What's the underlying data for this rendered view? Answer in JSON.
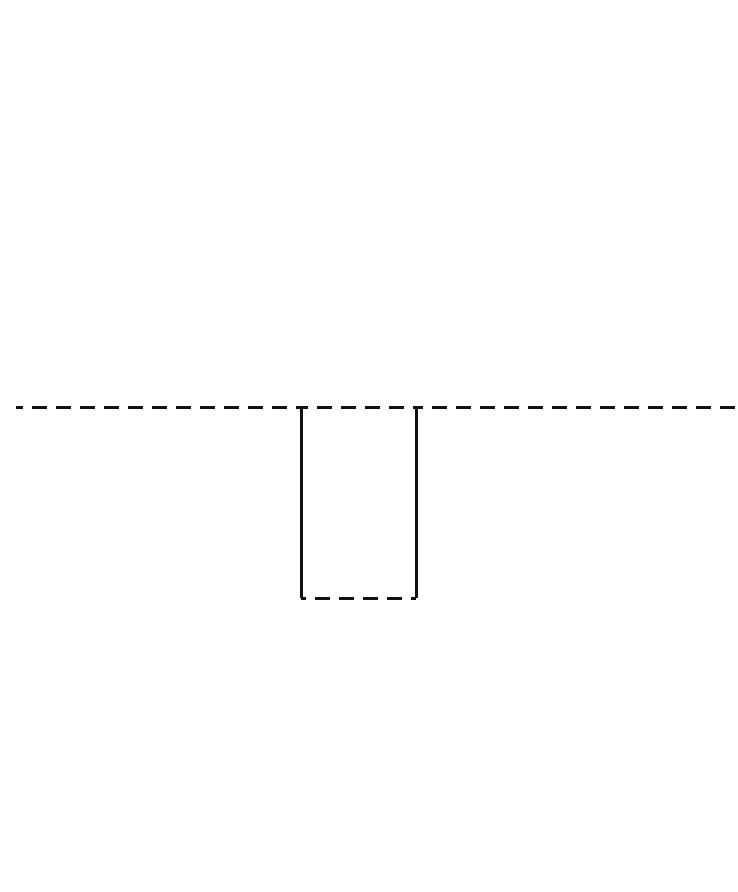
{
  "canvas": {
    "width": 738,
    "height": 892,
    "background_color": "#ffffff"
  },
  "figure": {
    "title": "",
    "description": "Minimal line diagram: a horizontal dashed baseline crossing the full image width, interrupted by a rectangular downward notch with solid vertical sides and a dashed bottom edge.",
    "stroke_color": "#111111",
    "stroke_width": 3.4,
    "dash_pattern": "15 9",
    "dash_period": 24
  },
  "chart_data": {
    "type": "line",
    "title": "",
    "xlabel": "",
    "ylabel": "",
    "xlim": [
      0,
      738
    ],
    "ylim": [
      892,
      0
    ],
    "grid": false,
    "legend": null,
    "series": [
      {
        "name": "baseline-left",
        "style": "dashed",
        "color": "#111111",
        "points": [
          [
            0,
            407
          ],
          [
            301,
            407
          ]
        ]
      },
      {
        "name": "notch-top-span",
        "style": "dashed",
        "color": "#111111",
        "points": [
          [
            301,
            407
          ],
          [
            416,
            407
          ]
        ]
      },
      {
        "name": "baseline-right",
        "style": "dashed",
        "color": "#111111",
        "points": [
          [
            416,
            407
          ],
          [
            738,
            407
          ]
        ]
      },
      {
        "name": "notch-left-wall",
        "style": "solid",
        "color": "#111111",
        "points": [
          [
            301,
            407
          ],
          [
            301,
            598
          ]
        ]
      },
      {
        "name": "notch-right-wall",
        "style": "solid",
        "color": "#111111",
        "points": [
          [
            416,
            407
          ],
          [
            416,
            598
          ]
        ]
      },
      {
        "name": "notch-bottom",
        "style": "dashed",
        "color": "#111111",
        "points": [
          [
            301,
            598
          ],
          [
            416,
            598
          ]
        ]
      }
    ],
    "annotations": [
      {
        "name": "left-edge-fade",
        "kind": "gradient-fade",
        "at": [
          0,
          407
        ],
        "note": "Leftmost dash fades to transparent at the image border."
      }
    ]
  },
  "geometry": {
    "baseline_y": 407,
    "notch_left_x": 301,
    "notch_right_x": 416,
    "notch_bottom_y": 598,
    "notch_width": 115,
    "notch_depth": 191
  }
}
